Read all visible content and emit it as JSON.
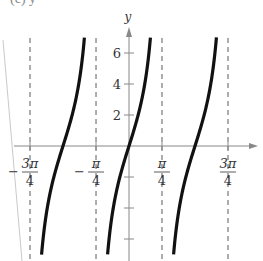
{
  "header": {
    "partial_text": "(c) y ="
  },
  "chart_data": {
    "type": "line",
    "title": "",
    "function_hint": "y = k·tan(2x), k ≈ 4",
    "xlabel": "",
    "ylabel": "y",
    "xlim": [
      -1.0,
      1.0
    ],
    "ylim": [
      -7,
      7
    ],
    "grid": false,
    "x_ticks": [
      {
        "value": -2.356,
        "label_num": "3π",
        "label_den": "4",
        "sign": "−"
      },
      {
        "value": -0.785,
        "label_num": "π",
        "label_den": "4",
        "sign": "−"
      },
      {
        "value": 0.785,
        "label_num": "π",
        "label_den": "4",
        "sign": ""
      },
      {
        "value": 2.356,
        "label_num": "3π",
        "label_den": "4",
        "sign": ""
      }
    ],
    "y_ticks": [
      {
        "value": 6,
        "label": "6"
      },
      {
        "value": 4,
        "label": "4"
      },
      {
        "value": 2,
        "label": "2"
      },
      {
        "value": -2,
        "label": ""
      },
      {
        "value": -4,
        "label": ""
      },
      {
        "value": -6,
        "label": ""
      }
    ],
    "asymptotes": [
      -2.356,
      -0.785,
      0.785,
      2.356
    ],
    "branches": [
      {
        "name": "far-left partial",
        "x_from": -2.48,
        "x_to": -2.41
      },
      {
        "name": "left branch",
        "center": -1.571
      },
      {
        "name": "center branch",
        "center": 0
      },
      {
        "name": "right branch",
        "center": 1.571
      },
      {
        "name": "far-right partial",
        "x_from": 2.43,
        "x_to": 2.49
      }
    ],
    "amplitude_k": 4.3,
    "zero_crossings": [
      -1.571,
      0,
      1.571
    ]
  },
  "layout": {
    "origin_px": [
      129,
      146
    ],
    "px_per_quarter_pi": 33,
    "px_per_unit_y": 15.5,
    "x_axis_end_px": 258,
    "y_axis_top_px": 27,
    "y_axis_bottom_px": 261
  },
  "colors": {
    "curve": "#111111",
    "axis": "#888888",
    "asymptote": "#777777",
    "text": "#333333"
  }
}
